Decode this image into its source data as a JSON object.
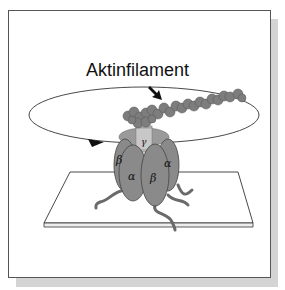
{
  "diagram": {
    "title_label": "Aktinfilament",
    "subunits": {
      "gamma": "γ",
      "alpha_left": "α",
      "alpha_right": "α",
      "beta_left": "β",
      "beta_center": "β"
    },
    "colors": {
      "protein": "#8a8a8a",
      "protein_dark": "#5e5e5e",
      "gamma_stalk": "#c4c4c4",
      "frame_shadow": "#d4d4d4",
      "outline": "#333333"
    }
  }
}
